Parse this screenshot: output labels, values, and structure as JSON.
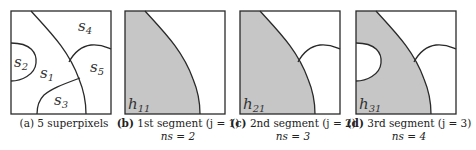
{
  "figure": {
    "panels": [
      {
        "id": "a",
        "tag": "(a)",
        "caption": "5 superpixels",
        "ns": "",
        "superpixel_labels": [
          "s1",
          "s2",
          "s3",
          "s4",
          "s5"
        ]
      },
      {
        "id": "b",
        "tag": "(b)",
        "caption": "1st segment (j = 1)",
        "ns": "ns = 2",
        "region_label": "h11"
      },
      {
        "id": "c",
        "tag": "(c)",
        "caption": "2nd segment (j = 2)",
        "ns": "ns = 3",
        "region_label": "h21"
      },
      {
        "id": "d",
        "tag": "(d)",
        "caption": "3rd segment (j = 3)",
        "ns": "ns = 4",
        "region_label": "h31"
      }
    ],
    "colors": {
      "shaded_region": "#c6c6c6",
      "outline": "#2a2a2a",
      "background": "#ffffff"
    }
  }
}
